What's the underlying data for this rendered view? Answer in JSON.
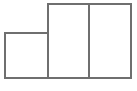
{
  "figure": {
    "name": "three-adjacent-rectangles-diagram",
    "canvas": {
      "width": 137,
      "height": 91,
      "background_color": "#ffffff"
    },
    "style": {
      "stroke_color": "#6f6f6f",
      "stroke_width": 1.5,
      "fill_color": "#ffffff"
    },
    "shapes": [
      {
        "id": "left-square",
        "label": "Left small square",
        "x": 5,
        "y": 33,
        "width": 43,
        "height": 45
      },
      {
        "id": "middle-rectangle",
        "label": "Middle tall rectangle",
        "x": 48,
        "y": 4,
        "width": 41,
        "height": 74
      },
      {
        "id": "right-rectangle",
        "label": "Right tall rectangle",
        "x": 89,
        "y": 4,
        "width": 42,
        "height": 74
      }
    ],
    "shared_edges": [
      {
        "id": "left-middle-shared-edge",
        "label": "Shared vertical edge between left square and middle rectangle",
        "x": 48,
        "y1": 4,
        "y2": 78
      },
      {
        "id": "middle-right-shared-edge",
        "label": "Shared vertical edge between middle and right rectangles",
        "x": 89,
        "y1": 4,
        "y2": 78
      }
    ]
  }
}
